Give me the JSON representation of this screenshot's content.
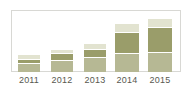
{
  "chart_data": {
    "type": "bar",
    "title": "",
    "subtitle": "",
    "xlabel": "",
    "ylabel": "",
    "stacked": true,
    "grid": false,
    "legend": "none",
    "frame": true,
    "ylim": [
      0,
      100
    ],
    "categories": [
      "2011",
      "2012",
      "2013",
      "2014",
      "2015"
    ],
    "series": [
      {
        "name": "segment-bottom",
        "color": "#b6b894",
        "values": [
          13,
          17,
          22,
          29,
          31
        ]
      },
      {
        "name": "segment-middle",
        "color": "#9a9d6a",
        "values": [
          7,
          12,
          14,
          34,
          40
        ]
      },
      {
        "name": "segment-top",
        "color": "#e2e3d0",
        "values": [
          7,
          7,
          10,
          14,
          15
        ]
      }
    ],
    "totals": [
      27,
      36,
      46,
      77,
      86
    ],
    "colors": {
      "bottom": "#b6b894",
      "middle": "#9a9d6a",
      "top": "#e2e3d0",
      "frame_border": "#d8d8d4",
      "tick_text": "#58584f",
      "background": "#ffffff",
      "segment_divider": "#ffffff"
    },
    "bar_geometry": [
      {
        "category": "2011",
        "left": 7,
        "width": 22
      },
      {
        "category": "2012",
        "left": 40,
        "width": 22
      },
      {
        "category": "2013",
        "left": 73,
        "width": 22
      },
      {
        "category": "2014",
        "left": 104,
        "width": 24
      },
      {
        "category": "2015",
        "left": 137,
        "width": 24
      }
    ],
    "tick_geometry": [
      {
        "label": "2011",
        "left": 5,
        "width": 26
      },
      {
        "label": "2012",
        "left": 38,
        "width": 26
      },
      {
        "label": "2013",
        "left": 71,
        "width": 26
      },
      {
        "label": "2014",
        "left": 103,
        "width": 26
      },
      {
        "label": "2015",
        "left": 136,
        "width": 26
      }
    ]
  }
}
